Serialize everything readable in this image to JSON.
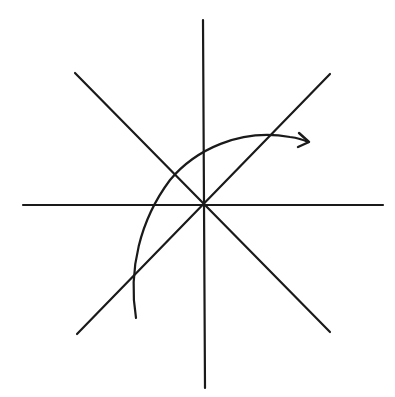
{
  "diagram": {
    "stroke_color": "#1a1a1a",
    "background": "#ffffff",
    "center": [
      203,
      205
    ],
    "lines": [
      {
        "name": "vertical-axis",
        "x1": 203,
        "y1": 20,
        "x2": 205,
        "y2": 388
      },
      {
        "name": "horizontal-axis",
        "x1": 23,
        "y1": 205,
        "x2": 383,
        "y2": 205
      },
      {
        "name": "diagonal-ne-sw",
        "x1": 77,
        "y1": 334,
        "x2": 330,
        "y2": 74
      },
      {
        "name": "diagonal-nw-se",
        "x1": 75,
        "y1": 73,
        "x2": 330,
        "y2": 332
      }
    ],
    "rotation_arrow": {
      "path": "M136,318 C128,270 140,220 170,180 C195,150 240,128 290,137 C298,138 304,140 308,142",
      "head": "M299,133 L309,142 L298,147",
      "direction": "clockwise"
    }
  }
}
